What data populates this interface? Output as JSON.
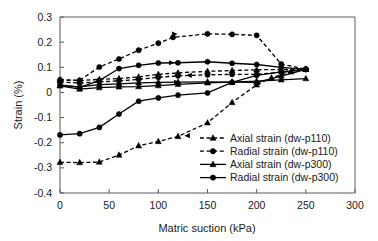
{
  "chart_data": {
    "type": "line",
    "title": "",
    "xlabel": "Matric suction (kPa)",
    "ylabel": "Strain (%)",
    "xlim": [
      0,
      300
    ],
    "ylim": [
      -0.4,
      0.3
    ],
    "xticks": [
      "0",
      "50",
      "100",
      "150",
      "200",
      "250",
      "300"
    ],
    "yticks": [
      "0.3",
      "0.2",
      "0.1",
      "0",
      "-0.1",
      "-0.2",
      "-0.3",
      "-0.4"
    ],
    "grid": false,
    "legend_position": "lower right",
    "series": [
      {
        "name": "Axial strain (dw-p110)",
        "style": "dashed",
        "marker": "triangle",
        "x": [
          0,
          20,
          40,
          60,
          80,
          100,
          120,
          150,
          175,
          200,
          215,
          235,
          250
        ],
        "y": [
          -0.278,
          -0.279,
          -0.277,
          -0.249,
          -0.212,
          -0.195,
          -0.175,
          -0.121,
          -0.04,
          0.03,
          0.058,
          0.082,
          0.093
        ]
      },
      {
        "name": "Radial strain (dw-p110)",
        "style": "dashed",
        "marker": "circle",
        "x": [
          0,
          20,
          40,
          60,
          80,
          100,
          115,
          150,
          175,
          200,
          225,
          250
        ],
        "y": [
          0.05,
          0.048,
          0.101,
          0.133,
          0.168,
          0.196,
          0.219,
          0.233,
          0.231,
          0.227,
          0.113,
          0.092
        ]
      },
      {
        "name": "Axial strain (dw-p300)",
        "style": "solid",
        "marker": "triangle",
        "x": [
          0,
          20,
          40,
          60,
          80,
          100,
          120,
          150,
          175,
          200,
          225,
          250
        ],
        "y": [
          0.026,
          0.013,
          0.019,
          0.022,
          0.023,
          0.027,
          0.032,
          0.038,
          0.041,
          0.045,
          0.05,
          0.055
        ]
      },
      {
        "name": "Radial strain (dw-p300)",
        "style": "solid",
        "marker": "circle",
        "x": [
          0,
          20,
          40,
          60,
          80,
          100,
          120,
          150,
          175,
          200,
          225,
          250
        ],
        "y": [
          -0.169,
          -0.164,
          -0.139,
          -0.086,
          -0.035,
          -0.022,
          -0.011,
          -0.002,
          0.04,
          0.068,
          0.082,
          0.092
        ]
      },
      {
        "name": "Radial strain upper (dw-p300 branch)",
        "style": "solid",
        "marker": "circle",
        "x": [
          0,
          20,
          40,
          60,
          80,
          100,
          120,
          150,
          175,
          200,
          225,
          250
        ],
        "y": [
          0.03,
          0.02,
          0.047,
          0.095,
          0.108,
          0.117,
          0.118,
          0.122,
          0.116,
          0.111,
          0.1,
          0.092
        ]
      },
      {
        "name": "Axial strain upper (dw-p110 branch)",
        "style": "dashed",
        "marker": "triangle",
        "x": [
          0,
          20,
          40,
          60,
          80,
          100,
          120,
          150,
          175,
          200,
          225,
          250
        ],
        "y": [
          0.05,
          0.047,
          0.052,
          0.055,
          0.062,
          0.072,
          0.078,
          0.084,
          0.087,
          0.09,
          0.091,
          0.092
        ]
      },
      {
        "name": "Axial strain lower flat (dw-p300 branch)",
        "style": "solid",
        "marker": "triangle",
        "x": [
          0,
          20,
          40,
          60,
          80,
          100,
          120,
          150,
          175,
          200,
          225,
          250
        ],
        "y": [
          0.028,
          0.022,
          0.031,
          0.034,
          0.038,
          0.04,
          0.041,
          0.042,
          0.041,
          0.04,
          0.065,
          0.092
        ]
      },
      {
        "name": "Radial mid flat (dw-p110 branch)",
        "style": "dashed",
        "marker": "circle",
        "x": [
          0,
          20,
          40,
          60,
          80,
          100,
          120,
          150,
          175,
          200,
          225,
          250
        ],
        "y": [
          0.042,
          0.037,
          0.042,
          0.046,
          0.052,
          0.06,
          0.066,
          0.07,
          0.072,
          0.072,
          0.08,
          0.092
        ]
      }
    ]
  },
  "legend": {
    "entries": [
      {
        "label": "Axial strain (dw-p110)",
        "style": "dashed",
        "marker": "triangle"
      },
      {
        "label": "Radial strain (dw-p110)",
        "style": "dashed",
        "marker": "circle"
      },
      {
        "label": "Axial strain (dw-p300)",
        "style": "solid",
        "marker": "triangle"
      },
      {
        "label": "Radial strain (dw-p300)",
        "style": "solid",
        "marker": "circle"
      }
    ]
  },
  "colors": {
    "line": "#000000",
    "axis": "#5a5a5a",
    "background": "#ffffff",
    "text": "#1a1a1a"
  }
}
